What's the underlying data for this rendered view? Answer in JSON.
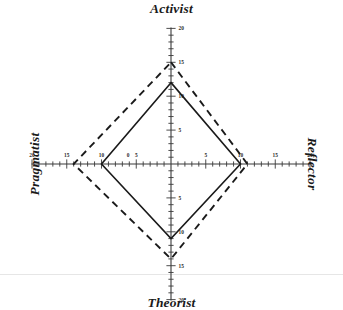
{
  "chart_data": {
    "type": "radar",
    "title": "",
    "axes": [
      {
        "name": "Activist",
        "direction": "up"
      },
      {
        "name": "Reflector",
        "direction": "right"
      },
      {
        "name": "Theorist",
        "direction": "down"
      },
      {
        "name": "Pragmatist",
        "direction": "left"
      }
    ],
    "categories": [
      "Activist",
      "Reflector",
      "Theorist",
      "Pragmatist"
    ],
    "axis_range": [
      0,
      20
    ],
    "tick_labels": [
      "5",
      "10",
      "15",
      "20"
    ],
    "tick_values": [
      5,
      10,
      15,
      20
    ],
    "minor_tick_step": 1,
    "grid": false,
    "legend": "none",
    "series": [
      {
        "name": "solid",
        "style": "solid",
        "color": "#1a1a1a",
        "values": [
          12,
          10,
          11,
          10
        ]
      },
      {
        "name": "dashed",
        "style": "dashed",
        "color": "#1a1a1a",
        "values": [
          15,
          11,
          14,
          14
        ]
      }
    ],
    "center_label": "0"
  },
  "titles": {
    "top": "Activist",
    "right": "Reflector",
    "bottom": "Theorist",
    "left": "Pragmatist"
  },
  "ticks": {
    "up": [
      "5",
      "10",
      "15",
      "20"
    ],
    "right": [
      "5",
      "10",
      "15",
      "20"
    ],
    "down": [
      "5",
      "10",
      "15",
      "20"
    ],
    "left": [
      "5",
      "10",
      "15",
      "20"
    ]
  },
  "colors": {
    "ink": "#1a1a1a",
    "axis": "#3a3a3a",
    "rule": "#e2e2e2",
    "background": "#ffffff"
  }
}
